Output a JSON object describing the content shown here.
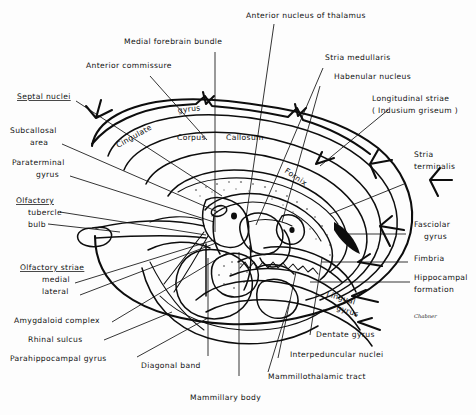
{
  "figure": {
    "background_color": "#fdfdfd",
    "ink_color": "#0d0d0d",
    "width": 476,
    "height": 415,
    "signature": "Chabner"
  },
  "labels": {
    "anterior_nucleus_of_thalamus": "Anterior  nucleus  of  thalamus",
    "medial_forebrain_bundle": "Medial  forebrain  bundle",
    "anterior_commissure": "Anterior  commissure",
    "stria_medullaris": "Stria  medullaris",
    "habenular_nucleus": "Habenular  nucleus",
    "longitudinal_striae": "Longitudinal  striae",
    "indusium_griseum": "( Indusium  griseum )",
    "septal_nuclei": "Septal nuclei",
    "subcallosal_area_1": "Subcallosal",
    "subcallosal_area_2": "area",
    "paraterminal_gyrus_1": "Paraterminal",
    "paraterminal_gyrus_2": "gyrus",
    "olfactory": "Olfactory",
    "olfactory_tubercle": "tubercle",
    "olfactory_bulb": "bulb",
    "olfactory_striae": "Olfactory  striae",
    "olfactory_striae_medial": "medial",
    "olfactory_striae_lateral": "lateral",
    "amygdaloid_complex": "Amygdaloid  complex",
    "rhinal_sulcus": "Rhinal  sulcus",
    "parahippocampal_gyrus": "Parahippocampal  gyrus",
    "diagonal_band": "Diagonal  band",
    "mammillary_body": "Mammillary  body",
    "mammillothalamic_tract": "Mammillothalamic  tract",
    "interpeduncular_nuclei": "Interpeduncular  nuclei",
    "dentate_gyrus": "Dentate  gyrus",
    "lingual_gyrus_1": "Lingual",
    "lingual_gyrus_2": "gyrus",
    "hippocampal_formation_1": "Hippocampal",
    "hippocampal_formation_2": "formation",
    "fimbria": "Fimbria",
    "fasciolar_gyrus_1": "Fasciolar",
    "fasciolar_gyrus_2": "gyrus",
    "stria_terminalis_1": "Stria",
    "stria_terminalis_2": "terminalis",
    "cingulate_gyrus_1": "Cingulate",
    "cingulate_gyrus_2": "gyrus",
    "corpus": "Corpus",
    "callosum": "Callosum",
    "fornix": "Fornix"
  }
}
